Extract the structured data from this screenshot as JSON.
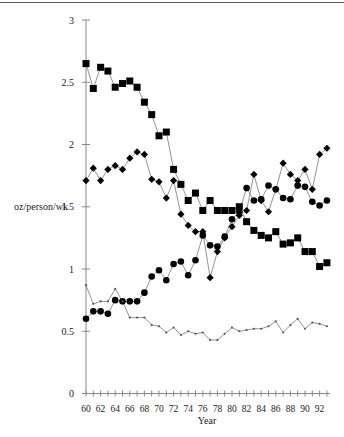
{
  "chart_data": {
    "type": "line",
    "title": "",
    "xlabel": "Year",
    "ylabel": "oz/person/wk",
    "ylim": [
      0,
      3
    ],
    "xlim": [
      60,
      93
    ],
    "grid": false,
    "legend": null,
    "y_ticks": [
      "0",
      "0.5",
      "1",
      "1.5",
      "2",
      "2.5",
      "3"
    ],
    "x_tick_labels": [
      "60",
      "62",
      "64",
      "66",
      "68",
      "70",
      "72",
      "74",
      "76",
      "78",
      "80",
      "82",
      "84",
      "86",
      "88",
      "90",
      "92"
    ],
    "x": [
      60,
      61,
      62,
      63,
      64,
      65,
      66,
      67,
      68,
      69,
      70,
      71,
      72,
      73,
      74,
      75,
      76,
      77,
      78,
      79,
      80,
      81,
      82,
      83,
      84,
      85,
      86,
      87,
      88,
      89,
      90,
      91,
      92,
      93
    ],
    "series": [
      {
        "name": "squares",
        "marker": "square",
        "values": [
          2.65,
          2.45,
          2.62,
          2.59,
          2.46,
          2.49,
          2.51,
          2.46,
          2.34,
          2.24,
          2.07,
          2.1,
          1.8,
          1.68,
          1.55,
          1.61,
          1.47,
          1.55,
          1.47,
          1.47,
          1.47,
          1.5,
          1.38,
          1.31,
          1.27,
          1.25,
          1.3,
          1.2,
          1.21,
          1.25,
          1.14,
          1.14,
          1.02,
          1.05
        ]
      },
      {
        "name": "diamonds",
        "marker": "diamond",
        "values": [
          1.71,
          1.81,
          1.71,
          1.8,
          1.83,
          1.8,
          1.89,
          1.94,
          1.92,
          1.72,
          1.7,
          1.57,
          1.71,
          1.44,
          1.35,
          1.3,
          1.3,
          0.93,
          1.14,
          1.25,
          1.34,
          1.43,
          1.47,
          1.76,
          1.55,
          1.46,
          1.64,
          1.85,
          1.76,
          1.71,
          1.8,
          1.64,
          1.92,
          1.97
        ]
      },
      {
        "name": "circles",
        "marker": "circle",
        "values": [
          0.6,
          0.66,
          0.66,
          0.64,
          0.75,
          0.74,
          0.74,
          0.74,
          0.81,
          0.94,
          0.99,
          0.91,
          1.04,
          1.06,
          0.95,
          1.07,
          1.27,
          1.19,
          1.18,
          1.26,
          1.4,
          1.46,
          1.65,
          1.55,
          1.56,
          1.67,
          1.64,
          1.57,
          1.56,
          1.67,
          1.66,
          1.54,
          1.51,
          1.55
        ]
      },
      {
        "name": "small-markers",
        "marker": "dot",
        "values": [
          0.87,
          0.72,
          0.74,
          0.74,
          0.84,
          0.74,
          0.61,
          0.61,
          0.61,
          0.55,
          0.54,
          0.49,
          0.53,
          0.47,
          0.5,
          0.48,
          0.49,
          0.43,
          0.43,
          0.48,
          0.53,
          0.5,
          0.51,
          0.52,
          0.52,
          0.54,
          0.58,
          0.49,
          0.55,
          0.6,
          0.52,
          0.57,
          0.56,
          0.54
        ]
      }
    ]
  },
  "colors": {
    "axis": "#888888",
    "line": "#777777",
    "marker": "#000000",
    "text": "#222222"
  }
}
